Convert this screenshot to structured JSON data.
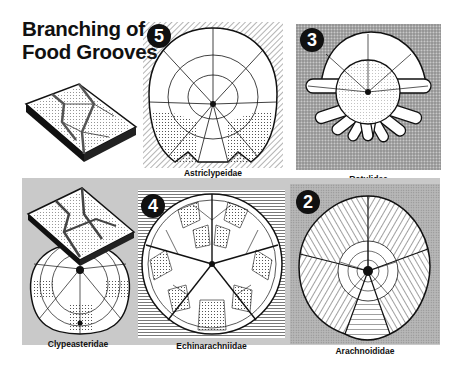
{
  "figure": {
    "title_line1": "Branching of",
    "title_line2": "Food Grooves"
  },
  "panels": [
    {
      "id": "astriclypeidae",
      "badge": "5",
      "caption": "Astriclypeidae",
      "background": "diagonal-hatch"
    },
    {
      "id": "rotulidae",
      "badge": "3",
      "caption": "Rotulidae",
      "background": "stipple"
    },
    {
      "id": "clypeasteridae",
      "badge": "",
      "caption": "Clypeasteridae",
      "background": "grey-band"
    },
    {
      "id": "echinarachniidae",
      "badge": "4",
      "caption": "Echinarachniidae",
      "background": "horizontal-lines"
    },
    {
      "id": "arachnoididae",
      "badge": "2",
      "caption": "Arachnoididae",
      "background": "dot-screen"
    }
  ],
  "colors": {
    "ink": "#111111",
    "band": "#c9c9c9",
    "stipple": "#a8a8a8",
    "paper": "#ffffff"
  }
}
